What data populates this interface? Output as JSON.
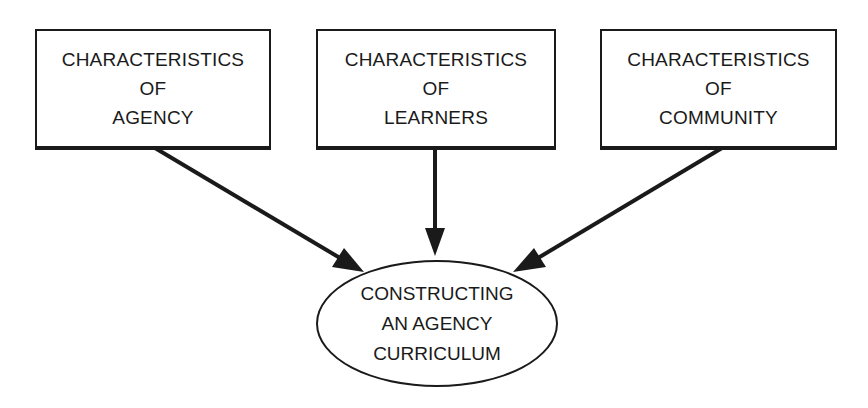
{
  "diagram": {
    "sources": [
      {
        "id": "agency",
        "lines": [
          "CHARACTERISTICS",
          "OF",
          "AGENCY"
        ]
      },
      {
        "id": "learners",
        "lines": [
          "CHARACTERISTICS",
          "OF",
          "LEARNERS"
        ]
      },
      {
        "id": "community",
        "lines": [
          "CHARACTERISTICS",
          "OF",
          "COMMUNITY"
        ]
      }
    ],
    "target": {
      "id": "curriculum",
      "lines": [
        "CONSTRUCTING",
        "AN AGENCY",
        "CURRICULUM"
      ]
    },
    "edges": [
      {
        "from": "agency",
        "to": "curriculum"
      },
      {
        "from": "learners",
        "to": "curriculum"
      },
      {
        "from": "community",
        "to": "curriculum"
      }
    ],
    "colors": {
      "stroke": "#1a1a1a",
      "background": "#ffffff"
    }
  }
}
